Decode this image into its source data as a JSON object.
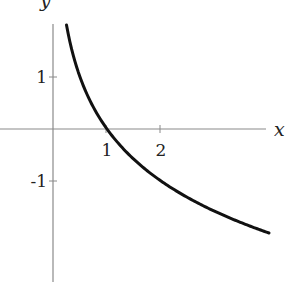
{
  "chart_data": {
    "type": "line",
    "title": "",
    "xlabel": "x",
    "ylabel": "y",
    "x_ticks": [
      1,
      2
    ],
    "x_tick_labels": [
      "1",
      "2"
    ],
    "y_ticks": [
      1,
      -1
    ],
    "y_tick_labels": [
      "1",
      "-1"
    ],
    "grid": false,
    "legend": null,
    "xlim": [
      -0.98,
      4.3
    ],
    "ylim": [
      -2.9,
      2.48
    ],
    "series": [
      {
        "name": "y = log_{1/2}(x)",
        "function": "-log2(x)",
        "x": [
          0.25,
          0.3,
          0.4,
          0.5,
          0.6,
          0.75,
          1.0,
          1.25,
          1.5,
          2.0,
          2.5,
          3.0,
          3.5,
          4.0
        ],
        "y": [
          2.0,
          1.74,
          1.32,
          1.0,
          0.74,
          0.42,
          0.0,
          -0.32,
          -0.58,
          -1.0,
          -1.32,
          -1.58,
          -1.81,
          -2.0
        ],
        "color": "#111111"
      }
    ]
  },
  "axes": {
    "x_label": "x",
    "y_label": "y",
    "x_tick_labels": [
      "1",
      "2"
    ],
    "y_tick_labels": [
      "1",
      "-1"
    ]
  },
  "style": {
    "axis_color": "#8a8a8a",
    "curve_color": "#111111",
    "background": "#ffffff"
  }
}
